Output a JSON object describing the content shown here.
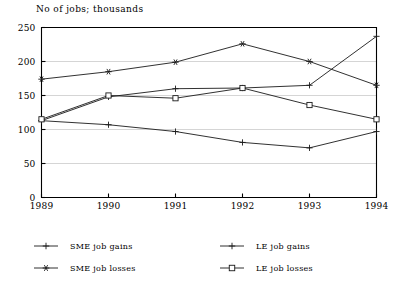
{
  "chart_data": {
    "type": "line",
    "title": "No of jobs; thousands",
    "xlabel": "",
    "ylabel": "",
    "categories": [
      "1989",
      "1990",
      "1991",
      "1992",
      "1993",
      "1994"
    ],
    "x": [
      1989,
      1990,
      1991,
      1992,
      1993,
      1994
    ],
    "xlim": [
      1989,
      1994
    ],
    "ylim": [
      0,
      250
    ],
    "yticks": [
      0,
      50,
      100,
      150,
      200,
      250
    ],
    "xticks": [
      "1989",
      "1990",
      "1991",
      "1992",
      "1993",
      "1994"
    ],
    "grid": "horizontal",
    "legend_position": "below-plot",
    "series": [
      {
        "name": "SME job gains",
        "marker": "plus",
        "values": [
          113,
          148,
          160,
          161,
          165,
          237
        ]
      },
      {
        "name": "SME job losses",
        "marker": "asterisk",
        "values": [
          174,
          185,
          199,
          226,
          200,
          165
        ]
      },
      {
        "name": "LE job gains",
        "marker": "plus",
        "values": [
          113,
          107,
          97,
          81,
          73,
          97
        ]
      },
      {
        "name": "LE job losses",
        "marker": "square",
        "values": [
          115,
          150,
          146,
          161,
          136,
          115
        ]
      }
    ]
  },
  "legend": {
    "entries": [
      {
        "label": "SME job gains",
        "marker": "plus"
      },
      {
        "label": "LE job gains",
        "marker": "plus"
      },
      {
        "label": "SME job losses",
        "marker": "asterisk"
      },
      {
        "label": "LE job losses",
        "marker": "square"
      }
    ]
  },
  "colors": {
    "ink": "#1a1a1a",
    "grid": "#b9b9b9",
    "background": "#ffffff"
  }
}
